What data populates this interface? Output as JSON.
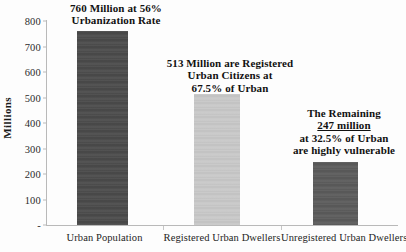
{
  "chart_data": {
    "type": "bar",
    "title": "",
    "xlabel": "",
    "ylabel": "Millions",
    "ylim": [
      0,
      800
    ],
    "ytick_step": 100,
    "grid": false,
    "legend": "none",
    "categories": [
      "Urban Population",
      "Registered Urban Dwellers",
      "Unregistered Urban Dwellers"
    ],
    "values": [
      760,
      513,
      247
    ],
    "ytick_labels": [
      "-",
      "100",
      "200",
      "300",
      "400",
      "500",
      "600",
      "700",
      "800"
    ],
    "ytick_values": [
      0,
      100,
      200,
      300,
      400,
      500,
      600,
      700,
      800
    ],
    "bar_colors": [
      "#4a4a4a",
      "#c8c8c8",
      "#5a5a5a"
    ],
    "annotations": [
      {
        "id": "annotation-urban-population",
        "lines": [
          {
            "text": "760 Million at 56%",
            "underline": false
          },
          {
            "text": "Urbanization Rate",
            "underline": false
          }
        ]
      },
      {
        "id": "annotation-registered",
        "lines": [
          {
            "text": "513 Million are Registered",
            "underline": false
          },
          {
            "text": "Urban Citizens at",
            "underline": false
          },
          {
            "text": "67.5% of Urban",
            "underline": false
          }
        ]
      },
      {
        "id": "annotation-unregistered",
        "lines": [
          {
            "text": "The Remaining",
            "underline": false
          },
          {
            "text": "247 million",
            "underline": true
          },
          {
            "text": "at 32.5% of Urban",
            "underline": false
          },
          {
            "text": "are highly vulnerable",
            "underline": false
          }
        ]
      }
    ]
  },
  "axis": {
    "y_title": "Millions"
  }
}
